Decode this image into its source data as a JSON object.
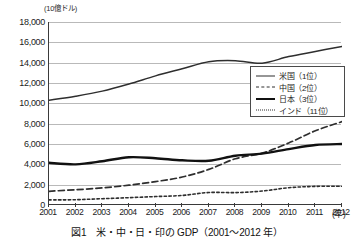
{
  "figure": {
    "caption": "図1　米・中・日・印の GDP（2001〜2012 年）",
    "unit_label": "(10億ドル)",
    "xaxis_unit": "(年)"
  },
  "legend": {
    "position": "inside-right-upper",
    "items": [
      {
        "label": "米国（1位）",
        "style": "solid-thin"
      },
      {
        "label": "中国（2位）",
        "style": "dashed"
      },
      {
        "label": "日本（3位）",
        "style": "solid-thick"
      },
      {
        "label": "インド（11位）",
        "style": "dotted"
      }
    ]
  },
  "chart_data": {
    "type": "line",
    "title": "図1　米・中・日・印の GDP（2001〜2012 年）",
    "xlabel": "(年)",
    "ylabel": "(10億ドル)",
    "x": [
      2001,
      2002,
      2003,
      2004,
      2005,
      2006,
      2007,
      2008,
      2009,
      2010,
      2011,
      2012
    ],
    "xtick_labels": [
      "2001",
      "2002",
      "2003",
      "2004",
      "2005",
      "2006",
      "2007",
      "2008",
      "2009",
      "2010",
      "2011",
      "2012"
    ],
    "ytick_labels": [
      "0",
      "2,000",
      "4,000",
      "6,000",
      "8,000",
      "10,000",
      "12,000",
      "14,000",
      "16,000",
      "18,000"
    ],
    "yticks": [
      0,
      2000,
      4000,
      6000,
      8000,
      10000,
      12000,
      14000,
      16000,
      18000
    ],
    "ylim": [
      0,
      18000
    ],
    "xlim": [
      2001,
      2012
    ],
    "grid": true,
    "series": [
      {
        "name": "米国（1位）",
        "rank": 1,
        "style": "solid-thin",
        "color": "#2e2e2e",
        "values": [
          10300,
          10700,
          11200,
          11900,
          12700,
          13400,
          14100,
          14200,
          13950,
          14600,
          15100,
          15600
        ]
      },
      {
        "name": "中国（2位）",
        "rank": 2,
        "style": "dashed",
        "color": "#2e2e2e",
        "values": [
          1350,
          1500,
          1680,
          1950,
          2300,
          2750,
          3500,
          4550,
          5100,
          6100,
          7300,
          8200
        ]
      },
      {
        "name": "日本（3位）",
        "rank": 3,
        "style": "solid-thick",
        "color": "#111111",
        "values": [
          4150,
          4000,
          4300,
          4700,
          4600,
          4400,
          4350,
          4850,
          5050,
          5500,
          5900,
          6000
        ]
      },
      {
        "name": "インド（11位）",
        "rank": 11,
        "style": "dotted",
        "color": "#2e2e2e",
        "values": [
          500,
          520,
          620,
          720,
          830,
          940,
          1230,
          1220,
          1370,
          1700,
          1830,
          1840
        ]
      }
    ]
  }
}
